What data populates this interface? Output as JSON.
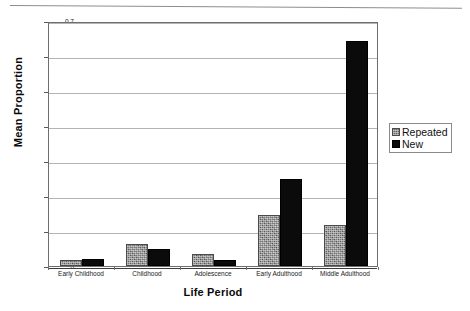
{
  "chart_data": {
    "type": "bar",
    "title": "",
    "xlabel": "Life Period",
    "ylabel": "Mean Proportion",
    "categories": [
      "Early Childhood",
      "Childhood",
      "Adolescence",
      "Early Adulthood",
      "Middle Adulthood"
    ],
    "series": [
      {
        "name": "Repeated",
        "color": "#6b6b6b",
        "values": [
          0.018,
          0.063,
          0.033,
          0.145,
          0.118
        ]
      },
      {
        "name": "New",
        "color": "#0b0b0b",
        "values": [
          0.02,
          0.05,
          0.017,
          0.25,
          0.642
        ]
      }
    ],
    "ylim": [
      0,
      0.7
    ],
    "yticks": [
      0,
      0.1,
      0.2,
      0.3,
      0.4,
      0.5,
      0.6,
      0.7
    ],
    "ytick_labels": [
      "0",
      "0.1",
      "0.2",
      "0.3",
      "0.4",
      "0.5",
      "0.6",
      "0.7"
    ],
    "grid": true,
    "grid_axis": "y",
    "legend_position": "right",
    "legend_entries": [
      "Repeated",
      "New"
    ]
  },
  "axes": {
    "y_title": "Mean Proportion",
    "x_title": "Life Period"
  },
  "legend": {
    "entries": [
      {
        "label": "Repeated",
        "swatch": "gray-textured-swatch"
      },
      {
        "label": "New",
        "swatch": "black-swatch"
      }
    ]
  }
}
